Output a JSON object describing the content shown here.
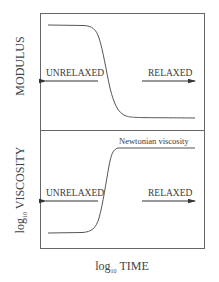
{
  "diagram": {
    "top_panel": {
      "ylabel": "MODULUS",
      "left_label": "UNRELAXED",
      "right_label": "RELAXED",
      "curve": "sigmoid-decreasing"
    },
    "bottom_panel": {
      "ylabel_prefix": "log",
      "ylabel_subscript": "10",
      "ylabel_main": "VISCOSITY",
      "left_label": "UNRELAXED",
      "right_label": "RELAXED",
      "plateau_annotation": "Newtonian viscosity",
      "curve": "sigmoid-increasing"
    },
    "xlabel_prefix": "log",
    "xlabel_subscript": "10",
    "xlabel_main": "TIME",
    "colors": {
      "line": "#555555",
      "frame": "#666666",
      "text": "#3a3a3a"
    }
  }
}
